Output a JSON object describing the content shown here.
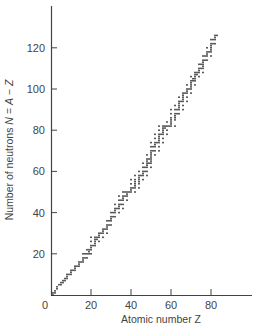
{
  "chart_data": {
    "type": "scatter",
    "title": "",
    "xlabel": "Atomic number Z",
    "ylabel": "Number of neutrons N = A − Z",
    "xlim": [
      0,
      103
    ],
    "ylim": [
      0,
      140
    ],
    "x_ticks": [
      0,
      20,
      40,
      60,
      80
    ],
    "y_ticks": [
      20,
      40,
      60,
      80,
      100,
      120
    ],
    "grid": false,
    "legend": null,
    "series": [
      {
        "name": "Stable nuclides",
        "marker": "small dot",
        "color": "#333333",
        "points_by_Z": [
          [
            1,
            [
              0,
              1
            ]
          ],
          [
            2,
            [
              1,
              2
            ]
          ],
          [
            3,
            [
              3,
              4
            ]
          ],
          [
            4,
            [
              5
            ]
          ],
          [
            5,
            [
              5,
              6
            ]
          ],
          [
            6,
            [
              6,
              7
            ]
          ],
          [
            7,
            [
              7,
              8
            ]
          ],
          [
            8,
            [
              8,
              9,
              10
            ]
          ],
          [
            9,
            [
              10
            ]
          ],
          [
            10,
            [
              10,
              11,
              12
            ]
          ],
          [
            11,
            [
              12
            ]
          ],
          [
            12,
            [
              12,
              13,
              14
            ]
          ],
          [
            13,
            [
              14
            ]
          ],
          [
            14,
            [
              14,
              15,
              16
            ]
          ],
          [
            15,
            [
              16
            ]
          ],
          [
            16,
            [
              16,
              17,
              18,
              20
            ]
          ],
          [
            17,
            [
              18,
              20
            ]
          ],
          [
            18,
            [
              18,
              20,
              22
            ]
          ],
          [
            19,
            [
              20,
              21,
              22
            ]
          ],
          [
            20,
            [
              20,
              22,
              23,
              24,
              26,
              28
            ]
          ],
          [
            21,
            [
              24
            ]
          ],
          [
            22,
            [
              24,
              25,
              26,
              27,
              28
            ]
          ],
          [
            23,
            [
              27,
              28
            ]
          ],
          [
            24,
            [
              26,
              28,
              29,
              30
            ]
          ],
          [
            25,
            [
              30
            ]
          ],
          [
            26,
            [
              28,
              30,
              31,
              32
            ]
          ],
          [
            27,
            [
              32
            ]
          ],
          [
            28,
            [
              30,
              32,
              33,
              34,
              36
            ]
          ],
          [
            29,
            [
              34,
              36
            ]
          ],
          [
            30,
            [
              34,
              36,
              37,
              38,
              40
            ]
          ],
          [
            31,
            [
              38,
              40
            ]
          ],
          [
            32,
            [
              38,
              40,
              41,
              42,
              44
            ]
          ],
          [
            33,
            [
              42
            ]
          ],
          [
            34,
            [
              40,
              42,
              43,
              44,
              46,
              48
            ]
          ],
          [
            35,
            [
              44,
              46
            ]
          ],
          [
            36,
            [
              42,
              44,
              46,
              47,
              48,
              50
            ]
          ],
          [
            37,
            [
              48,
              50
            ]
          ],
          [
            38,
            [
              46,
              48,
              49,
              50
            ]
          ],
          [
            39,
            [
              50
            ]
          ],
          [
            40,
            [
              50,
              51,
              52,
              54,
              56
            ]
          ],
          [
            41,
            [
              52
            ]
          ],
          [
            42,
            [
              50,
              52,
              53,
              54,
              55,
              56,
              58
            ]
          ],
          [
            44,
            [
              52,
              54,
              55,
              56,
              57,
              58,
              60
            ]
          ],
          [
            45,
            [
              58
            ]
          ],
          [
            46,
            [
              56,
              58,
              59,
              60,
              62,
              64
            ]
          ],
          [
            47,
            [
              60,
              62
            ]
          ],
          [
            48,
            [
              58,
              60,
              62,
              63,
              64,
              65,
              66,
              68
            ]
          ],
          [
            49,
            [
              64,
              66
            ]
          ],
          [
            50,
            [
              62,
              64,
              65,
              66,
              67,
              68,
              69,
              70,
              72,
              74
            ]
          ],
          [
            51,
            [
              70,
              72
            ]
          ],
          [
            52,
            [
              68,
              70,
              72,
              73,
              74,
              76,
              78
            ]
          ],
          [
            53,
            [
              74
            ]
          ],
          [
            54,
            [
              70,
              72,
              74,
              75,
              76,
              77,
              78,
              80,
              82
            ]
          ],
          [
            55,
            [
              78
            ]
          ],
          [
            56,
            [
              74,
              76,
              78,
              79,
              80,
              81,
              82
            ]
          ],
          [
            57,
            [
              81,
              82
            ]
          ],
          [
            58,
            [
              78,
              80,
              82,
              84
            ]
          ],
          [
            59,
            [
              82
            ]
          ],
          [
            60,
            [
              82,
              83,
              84,
              85,
              86,
              88,
              90
            ]
          ],
          [
            62,
            [
              82,
              85,
              86,
              87,
              88,
              90,
              92
            ]
          ],
          [
            63,
            [
              88,
              90
            ]
          ],
          [
            64,
            [
              88,
              90,
              91,
              92,
              93,
              94,
              96
            ]
          ],
          [
            65,
            [
              94
            ]
          ],
          [
            66,
            [
              90,
              92,
              94,
              95,
              96,
              97,
              98
            ]
          ],
          [
            67,
            [
              98
            ]
          ],
          [
            68,
            [
              94,
              96,
              98,
              99,
              100,
              102
            ]
          ],
          [
            69,
            [
              100
            ]
          ],
          [
            70,
            [
              98,
              100,
              101,
              102,
              103,
              104,
              106
            ]
          ],
          [
            71,
            [
              104,
              105
            ]
          ],
          [
            72,
            [
              102,
              104,
              105,
              106,
              107,
              108
            ]
          ],
          [
            73,
            [
              107,
              108
            ]
          ],
          [
            74,
            [
              106,
              108,
              109,
              110,
              112
            ]
          ],
          [
            75,
            [
              110,
              112
            ]
          ],
          [
            76,
            [
              108,
              110,
              111,
              112,
              113,
              114,
              116
            ]
          ],
          [
            77,
            [
              114,
              116
            ]
          ],
          [
            78,
            [
              114,
              116,
              117,
              118,
              120
            ]
          ],
          [
            79,
            [
              118
            ]
          ],
          [
            80,
            [
              116,
              118,
              119,
              120,
              121,
              122,
              124
            ]
          ],
          [
            81,
            [
              122,
              124
            ]
          ],
          [
            82,
            [
              122,
              124,
              125,
              126
            ]
          ],
          [
            83,
            [
              126
            ]
          ]
        ]
      }
    ]
  },
  "plot_area": {
    "origin_px": [
      51,
      295
    ],
    "x_px_per_unit": 2.0,
    "y_px_per_unit": 2.06,
    "x_axis_end_px": 252,
    "y_axis_top_px": 6
  },
  "labels": {
    "x_ticks": [
      "0",
      "20",
      "40",
      "60",
      "80"
    ],
    "y_ticks": [
      "20",
      "40",
      "60",
      "80",
      "100",
      "120"
    ],
    "xlabel": "Atomic number Z",
    "ylabel_parts": [
      "Number of neutrons ",
      "N",
      " = ",
      "A",
      " − ",
      "Z"
    ]
  }
}
